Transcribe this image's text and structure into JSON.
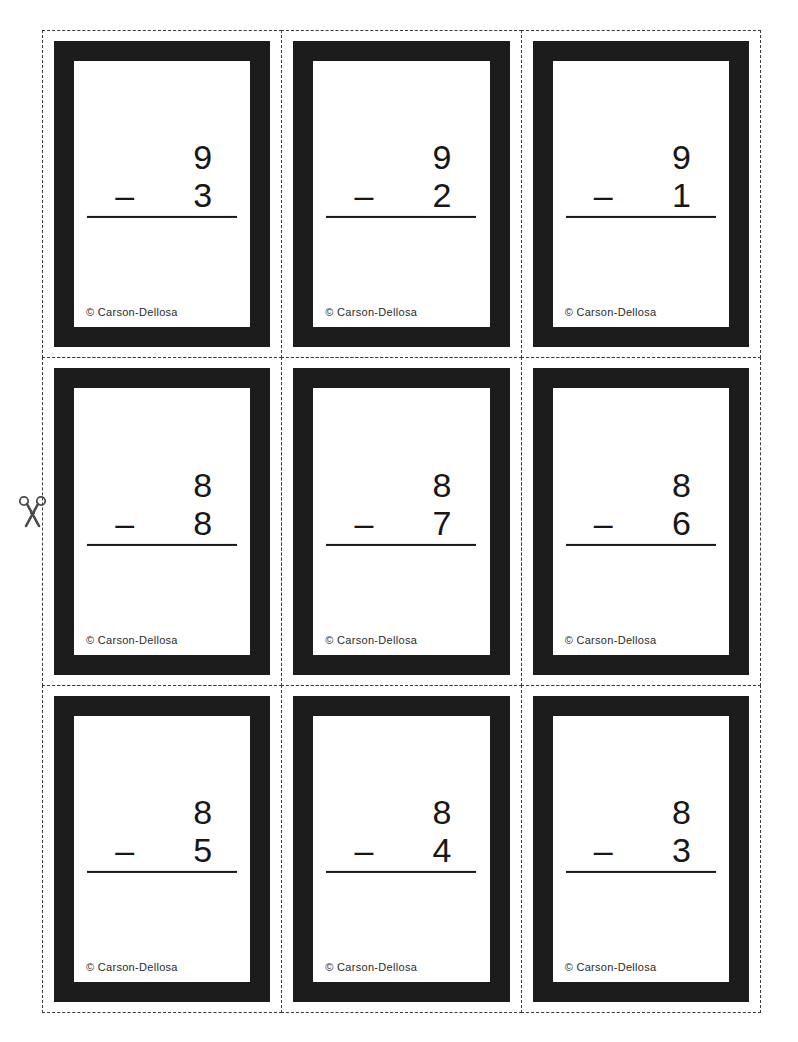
{
  "page": {
    "publisher_credit": "© Carson-Dellosa",
    "background_color": "#ffffff",
    "cut_line_color": "#3a3a3a",
    "card_border_color": "#1c1c1c",
    "digit_color": "#171717",
    "cut_marker_icon": "scissors-icon"
  },
  "cards": [
    {
      "id": "card-1",
      "minuend": "9",
      "operator": "–",
      "subtrahend": "3",
      "credit": "© Carson-Dellosa"
    },
    {
      "id": "card-2",
      "minuend": "9",
      "operator": "–",
      "subtrahend": "2",
      "credit": "© Carson-Dellosa"
    },
    {
      "id": "card-3",
      "minuend": "9",
      "operator": "–",
      "subtrahend": "1",
      "credit": "© Carson-Dellosa"
    },
    {
      "id": "card-4",
      "minuend": "8",
      "operator": "–",
      "subtrahend": "8",
      "credit": "© Carson-Dellosa"
    },
    {
      "id": "card-5",
      "minuend": "8",
      "operator": "–",
      "subtrahend": "7",
      "credit": "© Carson-Dellosa"
    },
    {
      "id": "card-6",
      "minuend": "8",
      "operator": "–",
      "subtrahend": "6",
      "credit": "© Carson-Dellosa"
    },
    {
      "id": "card-7",
      "minuend": "8",
      "operator": "–",
      "subtrahend": "5",
      "credit": "© Carson-Dellosa"
    },
    {
      "id": "card-8",
      "minuend": "8",
      "operator": "–",
      "subtrahend": "4",
      "credit": "© Carson-Dellosa"
    },
    {
      "id": "card-9",
      "minuend": "8",
      "operator": "–",
      "subtrahend": "3",
      "credit": "© Carson-Dellosa"
    }
  ]
}
